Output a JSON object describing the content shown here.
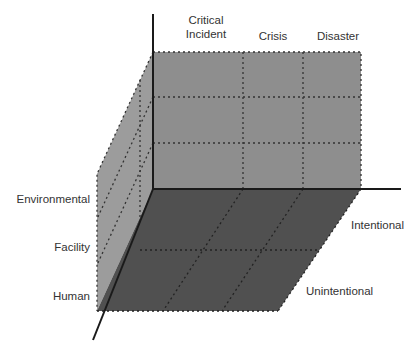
{
  "diagram": {
    "type": "3d-classification-cube",
    "colors": {
      "back_wall": "#8e8e8e",
      "left_wall": "#9a9a9a",
      "floor": "#4f4f4f",
      "axis": "#1a1a1a",
      "grid_dots": "#333333",
      "text": "#333333"
    },
    "top_axis": {
      "labels": [
        "Critical\nIncident",
        "Crisis",
        "Disaster"
      ],
      "label_line1": "Critical",
      "label_line2": "Incident",
      "label_crisis": "Crisis",
      "label_disaster": "Disaster"
    },
    "left_axis": {
      "labels": [
        "Environmental",
        "Facility",
        "Human"
      ]
    },
    "right_axis": {
      "labels": [
        "Intentional",
        "Unintentional"
      ]
    }
  }
}
